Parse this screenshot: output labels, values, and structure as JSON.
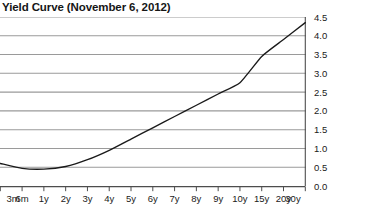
{
  "chart_data": {
    "type": "line",
    "title": "Yield Curve (November 6, 2012)",
    "xlabel": "",
    "ylabel": "",
    "categories": [
      "3m",
      "6m",
      "1y",
      "2y",
      "3y",
      "4y",
      "5y",
      "6y",
      "7y",
      "8y",
      "9y",
      "10y",
      "15y",
      "20y",
      "30y"
    ],
    "values": [
      0.6,
      0.47,
      0.45,
      0.52,
      0.7,
      0.95,
      1.25,
      1.55,
      1.85,
      2.15,
      2.45,
      2.75,
      3.45,
      3.9,
      4.35
    ],
    "series": [
      {
        "name": "Yield",
        "values": [
          0.6,
          0.47,
          0.45,
          0.52,
          0.7,
          0.95,
          1.25,
          1.55,
          1.85,
          2.15,
          2.45,
          2.75,
          3.45,
          3.9,
          4.35
        ]
      }
    ],
    "ylim": [
      0.0,
      4.5
    ],
    "yticks": [
      0.0,
      0.5,
      1.0,
      1.5,
      2.0,
      2.5,
      3.0,
      3.5,
      4.0,
      4.5
    ],
    "ytick_labels": [
      "0.0",
      "0.5",
      "1.0",
      "1.5",
      "2.0",
      "2.5",
      "3.0",
      "3.5",
      "4.0",
      "4.5"
    ],
    "y_axis_position": "right",
    "grid": true,
    "grid_axis": "y",
    "legend": false,
    "line_color": "#1a1a1a",
    "grid_color": "#9a9a9a",
    "axis_color": "#4d4d4d"
  }
}
